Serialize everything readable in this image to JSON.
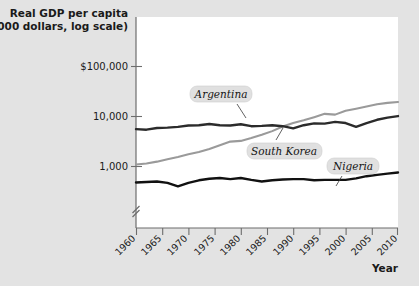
{
  "chart_data": {
    "type": "line",
    "title": "",
    "ylabel_lines": [
      "Real GDP per capita",
      "(2000 dollars, log scale)"
    ],
    "xlabel": "Year",
    "y_scale": "log",
    "y_tick_labels": [
      "$100,000",
      "10,000",
      "1,000"
    ],
    "y_tick_values": [
      100000,
      10000,
      1000
    ],
    "ylim": [
      300,
      200000
    ],
    "y_axis_break": true,
    "grid": false,
    "legend_position": "inline-annotations",
    "x_tick_labels": [
      "1960",
      "1965",
      "1970",
      "1975",
      "1980",
      "1985",
      "1990",
      "1995",
      "2000",
      "2005",
      "2010"
    ],
    "x_tick_values": [
      1960,
      1965,
      1970,
      1975,
      1980,
      1985,
      1990,
      1995,
      2000,
      2005,
      2010
    ],
    "xlim": [
      1960,
      2010
    ],
    "series": [
      {
        "name": "Argentina",
        "color": "#2b2b2b",
        "label_position": "above-line",
        "x": [
          1960,
          1962,
          1964,
          1966,
          1968,
          1970,
          1972,
          1974,
          1976,
          1978,
          1980,
          1982,
          1984,
          1986,
          1988,
          1990,
          1992,
          1994,
          1996,
          1998,
          2000,
          2002,
          2004,
          2006,
          2008,
          2010
        ],
        "values": [
          5600,
          5450,
          5900,
          6000,
          6200,
          6600,
          6700,
          7100,
          6700,
          6600,
          7000,
          6400,
          6500,
          6700,
          6400,
          5800,
          6700,
          7300,
          7200,
          7800,
          7400,
          6200,
          7400,
          8600,
          9500,
          10200
        ]
      },
      {
        "name": "South Korea",
        "color": "#9a9a9a",
        "label_position": "below-line",
        "x": [
          1960,
          1962,
          1964,
          1966,
          1968,
          1970,
          1972,
          1974,
          1976,
          1978,
          1980,
          1982,
          1984,
          1986,
          1988,
          1990,
          1992,
          1994,
          1996,
          1998,
          2000,
          2002,
          2004,
          2006,
          2008,
          2010
        ],
        "values": [
          1100,
          1150,
          1250,
          1400,
          1550,
          1750,
          1950,
          2250,
          2650,
          3150,
          3250,
          3700,
          4300,
          5100,
          6300,
          7400,
          8400,
          9700,
          11300,
          10900,
          13000,
          14300,
          15800,
          17600,
          18700,
          19500
        ]
      },
      {
        "name": "Nigeria",
        "color": "#111111",
        "label_position": "above-line",
        "x": [
          1960,
          1962,
          1964,
          1966,
          1968,
          1970,
          1972,
          1974,
          1976,
          1978,
          1980,
          1982,
          1984,
          1986,
          1988,
          1990,
          1992,
          1994,
          1996,
          1998,
          2000,
          2002,
          2004,
          2006,
          2008,
          2010
        ],
        "values": [
          480,
          490,
          500,
          470,
          400,
          470,
          530,
          570,
          590,
          560,
          590,
          540,
          500,
          530,
          550,
          560,
          560,
          530,
          540,
          540,
          540,
          580,
          640,
          680,
          720,
          760
        ]
      }
    ],
    "annotations": [
      {
        "text": "Argentina",
        "series": "Argentina"
      },
      {
        "text": "South Korea",
        "series": "South Korea"
      },
      {
        "text": "Nigeria",
        "series": "Nigeria"
      }
    ]
  },
  "colors": {
    "background": "#e3e3e3",
    "plot_background": "#ffffff",
    "axis": "#6d6d6d",
    "argentina": "#2b2b2b",
    "south_korea": "#9a9a9a",
    "nigeria": "#111111",
    "label_box": "#e0e0e0"
  }
}
